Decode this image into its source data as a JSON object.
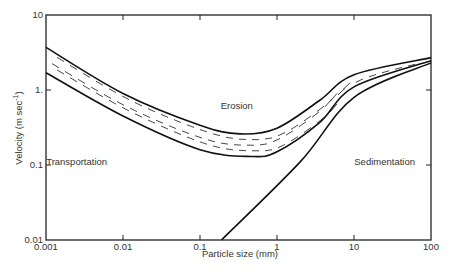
{
  "chart_data": {
    "type": "line",
    "title": "",
    "xlabel": "Particle size   (mm)",
    "ylabel": "Velocity   (m sec",
    "ylabel_sup": "-1",
    "ylabel_close": ")",
    "xscale": "log",
    "yscale": "log",
    "xlim": [
      0.001,
      100
    ],
    "ylim": [
      0.01,
      10
    ],
    "x_ticks": [
      {
        "value": 0.001,
        "label": "0.001"
      },
      {
        "value": 0.01,
        "label": "0.01"
      },
      {
        "value": 0.1,
        "label": "0.1"
      },
      {
        "value": 1,
        "label": "1"
      },
      {
        "value": 10,
        "label": "10"
      },
      {
        "value": 100,
        "label": "100"
      }
    ],
    "y_ticks": [
      {
        "value": 10,
        "label": "10"
      },
      {
        "value": 1,
        "label": "1."
      },
      {
        "value": 0.1,
        "label": "0.1"
      },
      {
        "value": 0.01,
        "label": "0.01"
      }
    ],
    "grid": false,
    "series": [
      {
        "name": "Erosion threshold (upper bound)",
        "x": [
          0.001,
          0.01,
          0.1,
          0.33,
          1,
          3.6,
          10,
          100
        ],
        "y": [
          3.7,
          0.9,
          0.34,
          0.26,
          0.31,
          0.73,
          1.6,
          2.7
        ]
      },
      {
        "name": "Erosion threshold (lower bound)",
        "x": [
          0.001,
          0.01,
          0.1,
          0.45,
          1,
          3.6,
          10,
          100
        ],
        "y": [
          1.7,
          0.45,
          0.16,
          0.13,
          0.15,
          0.37,
          1.1,
          2.45
        ]
      },
      {
        "name": "Sedimentation threshold",
        "x": [
          0.19,
          2,
          10,
          100
        ],
        "y": [
          0.01,
          0.11,
          0.8,
          2.3
        ]
      }
    ],
    "annotations": [
      {
        "text": "Erosion",
        "x": 0.3,
        "y": 0.55
      },
      {
        "text": "Transportation",
        "x": 0.0025,
        "y": 0.1
      },
      {
        "text": "Sedimentation",
        "x": 25,
        "y": 0.1
      }
    ]
  }
}
